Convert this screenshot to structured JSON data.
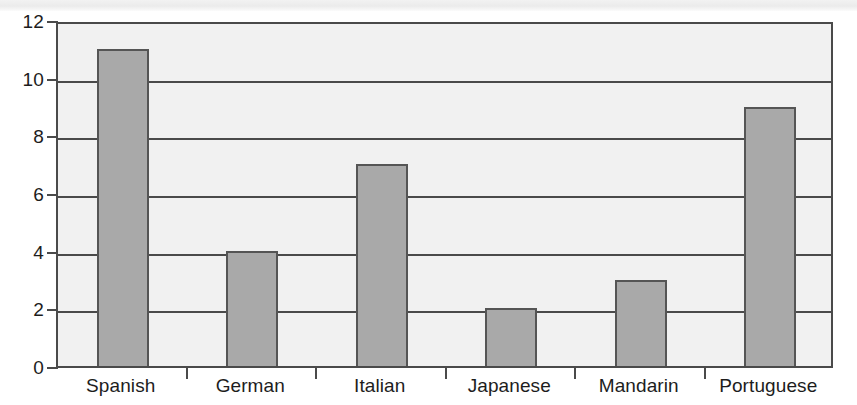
{
  "chart_data": {
    "type": "bar",
    "title": "",
    "subtitle": "",
    "xlabel": "",
    "ylabel": "",
    "categories": [
      "Spanish",
      "German",
      "Italian",
      "Japanese",
      "Mandarin",
      "Portuguese"
    ],
    "values": [
      11,
      4,
      7,
      2,
      3,
      9
    ],
    "series": [
      {
        "name": "",
        "values": [
          11,
          4,
          7,
          2,
          3,
          9
        ]
      }
    ],
    "ylim": [
      0,
      12
    ],
    "y_ticks": [
      0,
      2,
      4,
      6,
      8,
      10,
      12
    ],
    "y_tick_labels": [
      "0",
      "2",
      "4",
      "6",
      "8",
      "10",
      "12"
    ],
    "grid": true,
    "grid_axis": "y",
    "legend": false,
    "legend_position": "none",
    "annotations": [],
    "colors": {
      "bar_fill": "#a9a9a9",
      "bar_stroke": "#555555",
      "plot_background": "#f1f1f1",
      "axis": "#4a4a4a",
      "text": "#1d1d1d",
      "page_background": "#ffffff"
    }
  }
}
